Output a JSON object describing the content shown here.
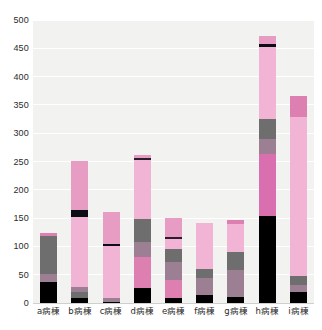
{
  "chart_data": {
    "type": "bar",
    "subtype": "stacked-vertical",
    "title": "",
    "xlabel": "",
    "ylabel": "",
    "ylim": [
      0,
      500
    ],
    "ytick_step": 50,
    "yticks": [
      0,
      50,
      100,
      150,
      200,
      250,
      300,
      350,
      400,
      450,
      500
    ],
    "ytick_labels": [
      "0",
      "50",
      "100",
      "150",
      "200",
      "250",
      "300",
      "350",
      "400",
      "450",
      "500"
    ],
    "grid": true,
    "grid_axis": "y",
    "legend": "none",
    "categories": [
      "a病棟",
      "b病棟",
      "c病棟",
      "d病棟",
      "e病棟",
      "f病棟",
      "g病棟",
      "h病棟",
      "i病棟"
    ],
    "series": [
      {
        "name": "series-1",
        "color": "#000000",
        "values": [
          37,
          8,
          2,
          27,
          9,
          14,
          10,
          153,
          19
        ]
      },
      {
        "name": "series-2",
        "color": "#6e6e6e",
        "values": [
          0,
          12,
          0,
          0,
          0,
          0,
          0,
          0,
          12
        ]
      },
      {
        "name": "series-3",
        "color": "#9c7f92",
        "values": [
          15,
          8,
          7,
          54,
          31,
          30,
          48,
          0,
          12
        ]
      },
      {
        "name": "series-4",
        "color": "#d96fae",
        "values": [
          0,
          0,
          0,
          0,
          0,
          0,
          0,
          110,
          0
        ]
      },
      {
        "name": "series-5",
        "color": "#6e6e6e",
        "values": [
          71,
          0,
          0,
          67,
          35,
          17,
          33,
          62,
          0
        ]
      },
      {
        "name": "series-6",
        "color": "#f2b4d4",
        "values": [
          0,
          125,
          94,
          0,
          40,
          80,
          55,
          0,
          0
        ]
      },
      {
        "name": "series-7",
        "color": "#2b1b2b",
        "values": [
          0,
          12,
          4,
          0,
          3,
          0,
          0,
          0,
          0
        ]
      },
      {
        "name": "series-8",
        "color": "#f2b4d4",
        "values": [
          0,
          86,
          53,
          105,
          33,
          0,
          0,
          130,
          265
        ]
      },
      {
        "name": "series-9",
        "color": "#2b1b2b",
        "values": [
          0,
          0,
          0,
          3,
          0,
          0,
          0,
          4,
          0
        ]
      },
      {
        "name": "series-10",
        "color": "#dd7fb0",
        "values": [
          0,
          0,
          0,
          5,
          0,
          0,
          0,
          12,
          37
        ]
      }
    ],
    "totals": [
      123,
      251,
      160,
      261,
      151,
      141,
      146,
      471,
      365
    ],
    "bars": [
      {
        "category": "a病棟",
        "total": 123,
        "segments": [
          {
            "color": "#000000",
            "from": 0,
            "to": 37,
            "value": 37
          },
          {
            "color": "#9c7f92",
            "from": 37,
            "to": 52,
            "value": 15
          },
          {
            "color": "#6e6e6e",
            "from": 52,
            "to": 118,
            "value": 66
          },
          {
            "color": "#dd7fb0",
            "from": 118,
            "to": 123,
            "value": 5
          }
        ]
      },
      {
        "category": "b病棟",
        "total": 251,
        "segments": [
          {
            "color": "#000000",
            "from": 0,
            "to": 8,
            "value": 8
          },
          {
            "color": "#6e6e6e",
            "from": 8,
            "to": 20,
            "value": 12
          },
          {
            "color": "#9c7f92",
            "from": 20,
            "to": 28,
            "value": 8
          },
          {
            "color": "#f2b4d4",
            "from": 28,
            "to": 152,
            "value": 124
          },
          {
            "color": "#0d0d14",
            "from": 152,
            "to": 164,
            "value": 12
          },
          {
            "color": "#e79cc4",
            "from": 164,
            "to": 251,
            "value": 87
          }
        ]
      },
      {
        "category": "c病棟",
        "total": 160,
        "segments": [
          {
            "color": "#000000",
            "from": 0,
            "to": 2,
            "value": 2
          },
          {
            "color": "#9c7f92",
            "from": 2,
            "to": 9,
            "value": 7
          },
          {
            "color": "#f2b4d4",
            "from": 9,
            "to": 101,
            "value": 92
          },
          {
            "color": "#0d0d14",
            "from": 101,
            "to": 105,
            "value": 4
          },
          {
            "color": "#e79cc4",
            "from": 105,
            "to": 160,
            "value": 55
          }
        ]
      },
      {
        "category": "d病棟",
        "total": 261,
        "segments": [
          {
            "color": "#000000",
            "from": 0,
            "to": 27,
            "value": 27
          },
          {
            "color": "#dd7fb0",
            "from": 27,
            "to": 81,
            "value": 54
          },
          {
            "color": "#9c7f92",
            "from": 81,
            "to": 108,
            "value": 27
          },
          {
            "color": "#6e6e6e",
            "from": 108,
            "to": 148,
            "value": 40
          },
          {
            "color": "#f2b4d4",
            "from": 148,
            "to": 253,
            "value": 105
          },
          {
            "color": "#2b1b2b",
            "from": 253,
            "to": 256,
            "value": 3
          },
          {
            "color": "#e79cc4",
            "from": 256,
            "to": 261,
            "value": 5
          }
        ]
      },
      {
        "category": "e病棟",
        "total": 151,
        "segments": [
          {
            "color": "#000000",
            "from": 0,
            "to": 9,
            "value": 9
          },
          {
            "color": "#dd7fb0",
            "from": 9,
            "to": 40,
            "value": 31
          },
          {
            "color": "#9c7f92",
            "from": 40,
            "to": 73,
            "value": 33
          },
          {
            "color": "#6e6e6e",
            "from": 73,
            "to": 95,
            "value": 22
          },
          {
            "color": "#f2b4d4",
            "from": 95,
            "to": 113,
            "value": 18
          },
          {
            "color": "#2b1b2b",
            "from": 113,
            "to": 116,
            "value": 3
          },
          {
            "color": "#e79cc4",
            "from": 116,
            "to": 151,
            "value": 35
          }
        ]
      },
      {
        "category": "f病棟",
        "total": 141,
        "segments": [
          {
            "color": "#000000",
            "from": 0,
            "to": 14,
            "value": 14
          },
          {
            "color": "#9c7f92",
            "from": 14,
            "to": 44,
            "value": 30
          },
          {
            "color": "#6e6e6e",
            "from": 44,
            "to": 61,
            "value": 17
          },
          {
            "color": "#f2b4d4",
            "from": 61,
            "to": 141,
            "value": 80
          }
        ]
      },
      {
        "category": "g病棟",
        "total": 146,
        "segments": [
          {
            "color": "#000000",
            "from": 0,
            "to": 10,
            "value": 10
          },
          {
            "color": "#9c7f92",
            "from": 10,
            "to": 58,
            "value": 48
          },
          {
            "color": "#6e6e6e",
            "from": 58,
            "to": 91,
            "value": 33
          },
          {
            "color": "#f2b4d4",
            "from": 91,
            "to": 140,
            "value": 49
          },
          {
            "color": "#dd7fb0",
            "from": 140,
            "to": 146,
            "value": 6
          }
        ]
      },
      {
        "category": "h病棟",
        "total": 471,
        "segments": [
          {
            "color": "#000000",
            "from": 0,
            "to": 153,
            "value": 153
          },
          {
            "color": "#d96fae",
            "from": 153,
            "to": 263,
            "value": 110
          },
          {
            "color": "#9c7f92",
            "from": 263,
            "to": 290,
            "value": 27
          },
          {
            "color": "#6e6e6e",
            "from": 290,
            "to": 325,
            "value": 35
          },
          {
            "color": "#f2b4d4",
            "from": 325,
            "to": 453,
            "value": 128
          },
          {
            "color": "#0d0d14",
            "from": 453,
            "to": 457,
            "value": 4
          },
          {
            "color": "#e79cc4",
            "from": 457,
            "to": 471,
            "value": 14
          }
        ]
      },
      {
        "category": "i病棟",
        "total": 365,
        "segments": [
          {
            "color": "#000000",
            "from": 0,
            "to": 19,
            "value": 19
          },
          {
            "color": "#9c7f92",
            "from": 19,
            "to": 31,
            "value": 12
          },
          {
            "color": "#6e6e6e",
            "from": 31,
            "to": 47,
            "value": 16
          },
          {
            "color": "#f2b4d4",
            "from": 47,
            "to": 328,
            "value": 281
          },
          {
            "color": "#dd7fb0",
            "from": 328,
            "to": 365,
            "value": 37
          }
        ]
      }
    ],
    "colors": {
      "plot_background": "#f2f2f0",
      "gridline": "#ffffff",
      "page_background": "#ffffff",
      "text": "#2b2b2b",
      "black": "#000000",
      "dark_gray": "#6e6e6e",
      "mauve": "#9c7f92",
      "rose": "#d96fae",
      "mid_pink": "#dd7fb0",
      "light_pink": "#f2b4d4",
      "pale_pink": "#e79cc4",
      "dark_purple": "#2b1b2b"
    }
  }
}
